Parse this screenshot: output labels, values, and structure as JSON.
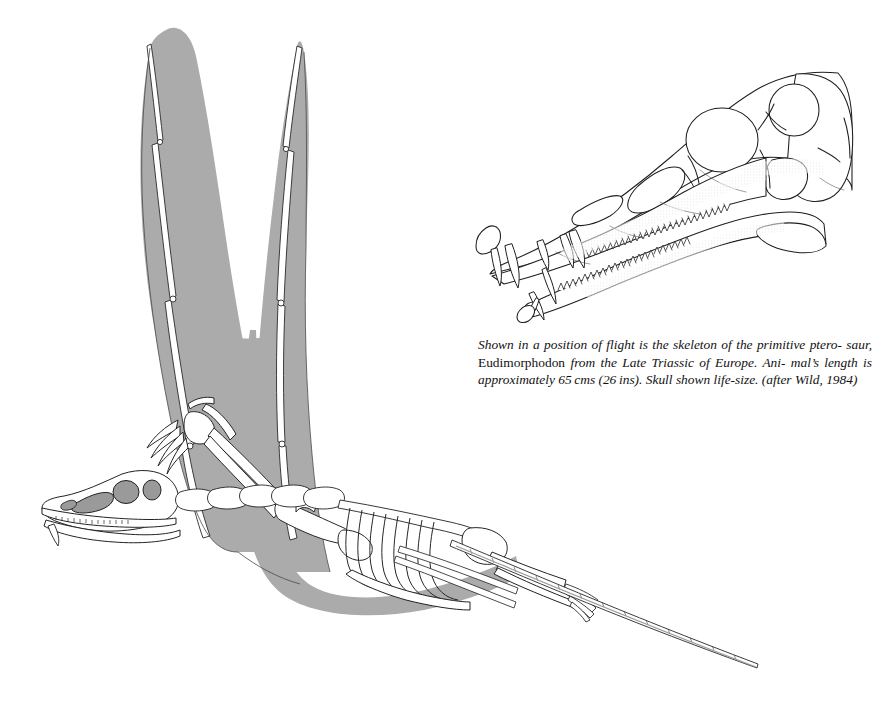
{
  "plate": {
    "title": "Eudimorphodon skeleton in flight with life-size skull",
    "subject": "Eudimorphodon",
    "background_color": "#ffffff",
    "ink_color": "#1a1a1a",
    "membrane_color": "#aaaaaa",
    "bone_fill_color": "#ffffff",
    "shadow_tone_color": "#8f8f8f"
  },
  "figures": {
    "skeleton": {
      "name": "flying-skeleton",
      "description": "Skeleton of the primitive pterosaur Eudimorphodon shown in a position of flight, with grey wing membranes spread upward and a long stiffened tail trailing to the lower right.",
      "parts": [
        "left-wing-membrane",
        "right-wing-membrane",
        "wing-finger-phalanges",
        "skull",
        "cervical-vertebrae",
        "ribcage",
        "dorsal-vertebrae",
        "pectoral-girdle",
        "humerus",
        "radius-ulna",
        "carpals",
        "manual-claws",
        "pelvis",
        "femur",
        "tibia",
        "pes",
        "caudal-vertebrae-tail"
      ]
    },
    "skull": {
      "name": "life-size-skull",
      "description": "Lateral view line drawing of the Eudimorphodon skull and lower jaw, life-size, showing orbit, antorbital fenestra, naris, temporal fenestrae and multicusped teeth with enlarged anterior fangs.",
      "parts": [
        "premaxilla",
        "maxilla",
        "external-naris",
        "antorbital-fenestra",
        "orbit",
        "lower-temporal-fenestra",
        "upper-temporal-fenestra",
        "quadrate",
        "jugal",
        "mandible",
        "upper-tooth-row",
        "lower-tooth-row",
        "anterior-fangs"
      ]
    }
  },
  "caption": {
    "line_1_a": "Shown in a position of flight is the skeleton of the primitive ptero-",
    "line_2_a": "saur,",
    "line_2_genus": "Eudimorphodon",
    "line_2_b": "from the Late Triassic of Europe. Ani-",
    "line_3": "mal’s length is approximately 65 cms (26 ins). Skull shown",
    "line_4": "life-size. (after Wild, 1984)",
    "full_text": "Shown in a position of flight is the skeleton of the primitive pterosaur, Eudimorphodon from the Late Triassic of Europe. Animal’s length is approximately 65 cms (26 ins). Skull shown life-size. (after Wild, 1984)",
    "genus_name": "Eudimorphodon",
    "length_cms": "65 cms",
    "length_ins": "26 ins",
    "age": "Late Triassic",
    "region": "Europe",
    "attribution": "(after Wild, 1984)",
    "source_author": "Wild",
    "source_year": "1984"
  }
}
